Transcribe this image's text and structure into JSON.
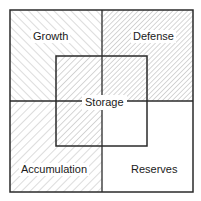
{
  "diagram": {
    "quadrants": [
      {
        "id": "growth",
        "label": "Growth",
        "pattern": "hatch-forward-sparse"
      },
      {
        "id": "defense",
        "label": "Defense",
        "pattern": "hatch-backward-dense"
      },
      {
        "id": "accumulation",
        "label": "Accumulation",
        "pattern": "hatch-backward-sparse"
      },
      {
        "id": "reserves",
        "label": "Reserves",
        "pattern": "none"
      }
    ],
    "center": {
      "id": "storage",
      "label": "Storage"
    },
    "colors": {
      "line": "#2a2a2a",
      "hatch": "#9a9a9a",
      "background": "#ffffff"
    }
  }
}
